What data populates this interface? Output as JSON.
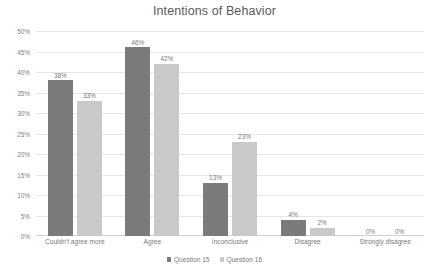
{
  "chart_data": {
    "type": "bar",
    "title": "Intentions of Behavior",
    "xlabel": "",
    "ylabel": "",
    "ylim": [
      0,
      50
    ],
    "ytick_labels": [
      "50%",
      "45%",
      "40%",
      "35%",
      "30%",
      "25%",
      "20%",
      "15%",
      "10%",
      "5%",
      "0%"
    ],
    "ytick_values": [
      50,
      45,
      40,
      35,
      30,
      25,
      20,
      15,
      10,
      5,
      0
    ],
    "grid": true,
    "legend_position": "bottom",
    "categories": [
      "Couldn't agree more",
      "Agree",
      "Inconclusive",
      "Disagree",
      "Strongly disagree"
    ],
    "series": [
      {
        "name": "Question 15",
        "color": "#7b7b7b",
        "values": [
          38,
          46,
          13,
          4,
          0
        ],
        "labels": [
          "38%",
          "46%",
          "13%",
          "4%",
          "0%"
        ]
      },
      {
        "name": "Question 16",
        "color": "#c9c9c9",
        "values": [
          33,
          42,
          23,
          2,
          0
        ],
        "labels": [
          "33%",
          "42%",
          "23%",
          "2%",
          "0%"
        ]
      }
    ]
  }
}
